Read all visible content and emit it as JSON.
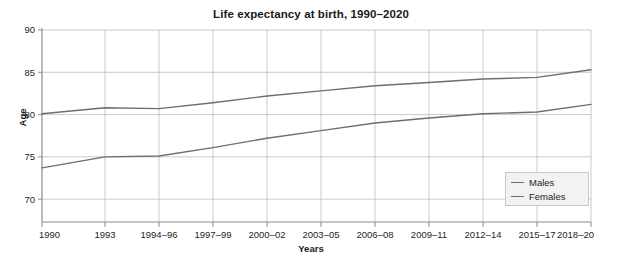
{
  "chart_data": {
    "type": "line",
    "title": "Life expectancy at birth, 1990–2020",
    "xlabel": "Years",
    "ylabel": "Age",
    "grid": true,
    "legend_position": "bottom-right",
    "ylim": [
      67.3,
      90
    ],
    "yticks": [
      70,
      75,
      80,
      85,
      90
    ],
    "ytick_labels": [
      "70",
      "75",
      "80",
      "85",
      "90"
    ],
    "categories": [
      "1990",
      "1993",
      "1994–96",
      "1997–99",
      "2000–02",
      "2003–05",
      "2006–08",
      "2009–11",
      "2012–14",
      "2015–17",
      "2018–20"
    ],
    "series": [
      {
        "name": "Males",
        "color": "#6e6e6e",
        "values": [
          73.7,
          75.0,
          75.1,
          76.1,
          77.2,
          78.1,
          79.0,
          79.6,
          80.1,
          80.3,
          81.2
        ]
      },
      {
        "name": "Females",
        "color": "#6e6e6e",
        "values": [
          80.1,
          80.8,
          80.7,
          81.4,
          82.2,
          82.8,
          83.4,
          83.8,
          84.2,
          84.4,
          85.3
        ]
      }
    ]
  },
  "legend": {
    "items": [
      {
        "label": "Males"
      },
      {
        "label": "Females"
      }
    ]
  },
  "colors": {
    "line": "#6e6e6e",
    "grid": "#bdbdbd",
    "axis": "#8c8c8c",
    "text": "#231f20"
  }
}
